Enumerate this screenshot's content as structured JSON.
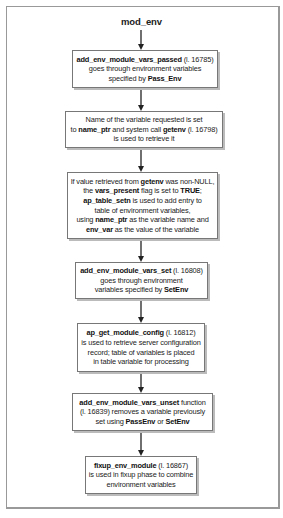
{
  "diagram": {
    "title": "mod_env",
    "steps": [
      {
        "lines": [
          [
            {
              "t": "add_env_module_vars_passed",
              "b": true
            },
            {
              "t": " (l. 16785)",
              "b": false
            }
          ],
          [
            {
              "t": "goes through environment variables",
              "b": false
            }
          ],
          [
            {
              "t": "specified by ",
              "b": false
            },
            {
              "t": "Pass_Env",
              "b": true
            }
          ]
        ]
      },
      {
        "lines": [
          [
            {
              "t": "Name of the variable requested is set",
              "b": false
            }
          ],
          [
            {
              "t": "to ",
              "b": false
            },
            {
              "t": "name_ptr",
              "b": true
            },
            {
              "t": " and system call ",
              "b": false
            },
            {
              "t": "getenv",
              "b": true
            },
            {
              "t": " (l. 16798)",
              "b": false
            }
          ],
          [
            {
              "t": "is used to retrieve it",
              "b": false
            }
          ]
        ]
      },
      {
        "lines": [
          [
            {
              "t": "If value retrieved from ",
              "b": false
            },
            {
              "t": "getenv",
              "b": true
            },
            {
              "t": " was non-NULL,",
              "b": false
            }
          ],
          [
            {
              "t": "the ",
              "b": false
            },
            {
              "t": "vars_present",
              "b": true
            },
            {
              "t": " flag is set to ",
              "b": false
            },
            {
              "t": "TRUE",
              "b": true
            },
            {
              "t": ";",
              "b": false
            }
          ],
          [
            {
              "t": "ap_table_setn",
              "b": true
            },
            {
              "t": " is used to add entry to",
              "b": false
            }
          ],
          [
            {
              "t": "table of environment variables,",
              "b": false
            }
          ],
          [
            {
              "t": "using ",
              "b": false
            },
            {
              "t": "name_ptr",
              "b": true
            },
            {
              "t": " as the variable name and",
              "b": false
            }
          ],
          [
            {
              "t": "env_var",
              "b": true
            },
            {
              "t": " as the value of the variable",
              "b": false
            }
          ]
        ]
      },
      {
        "lines": [
          [
            {
              "t": "add_env_module_vars_set",
              "b": true
            },
            {
              "t": " (l. 16808)",
              "b": false
            }
          ],
          [
            {
              "t": "goes through environment",
              "b": false
            }
          ],
          [
            {
              "t": "variables specified by ",
              "b": false
            },
            {
              "t": "SetEnv",
              "b": true
            }
          ]
        ]
      },
      {
        "lines": [
          [
            {
              "t": "ap_get_module_config",
              "b": true
            },
            {
              "t": " (l. 16812)",
              "b": false
            }
          ],
          [
            {
              "t": "is used to retrieve server configuration",
              "b": false
            }
          ],
          [
            {
              "t": "record; table of variables is placed",
              "b": false
            }
          ],
          [
            {
              "t": "in table variable for processing",
              "b": false
            }
          ]
        ]
      },
      {
        "lines": [
          [
            {
              "t": "add_env_module_vars_unset",
              "b": true
            },
            {
              "t": " function",
              "b": false
            }
          ],
          [
            {
              "t": "(l. 16839) removes a variable previously",
              "b": false
            }
          ],
          [
            {
              "t": "set using ",
              "b": false
            },
            {
              "t": "PassEnv",
              "b": true
            },
            {
              "t": " or ",
              "b": false
            },
            {
              "t": "SetEnv",
              "b": true
            }
          ]
        ]
      },
      {
        "lines": [
          [
            {
              "t": "fixup_env_module",
              "b": true
            },
            {
              "t": " (l. 16867)",
              "b": false
            }
          ],
          [
            {
              "t": "is used in fixup phase to combine",
              "b": false
            }
          ],
          [
            {
              "t": "environment variables",
              "b": false
            }
          ]
        ]
      }
    ]
  }
}
